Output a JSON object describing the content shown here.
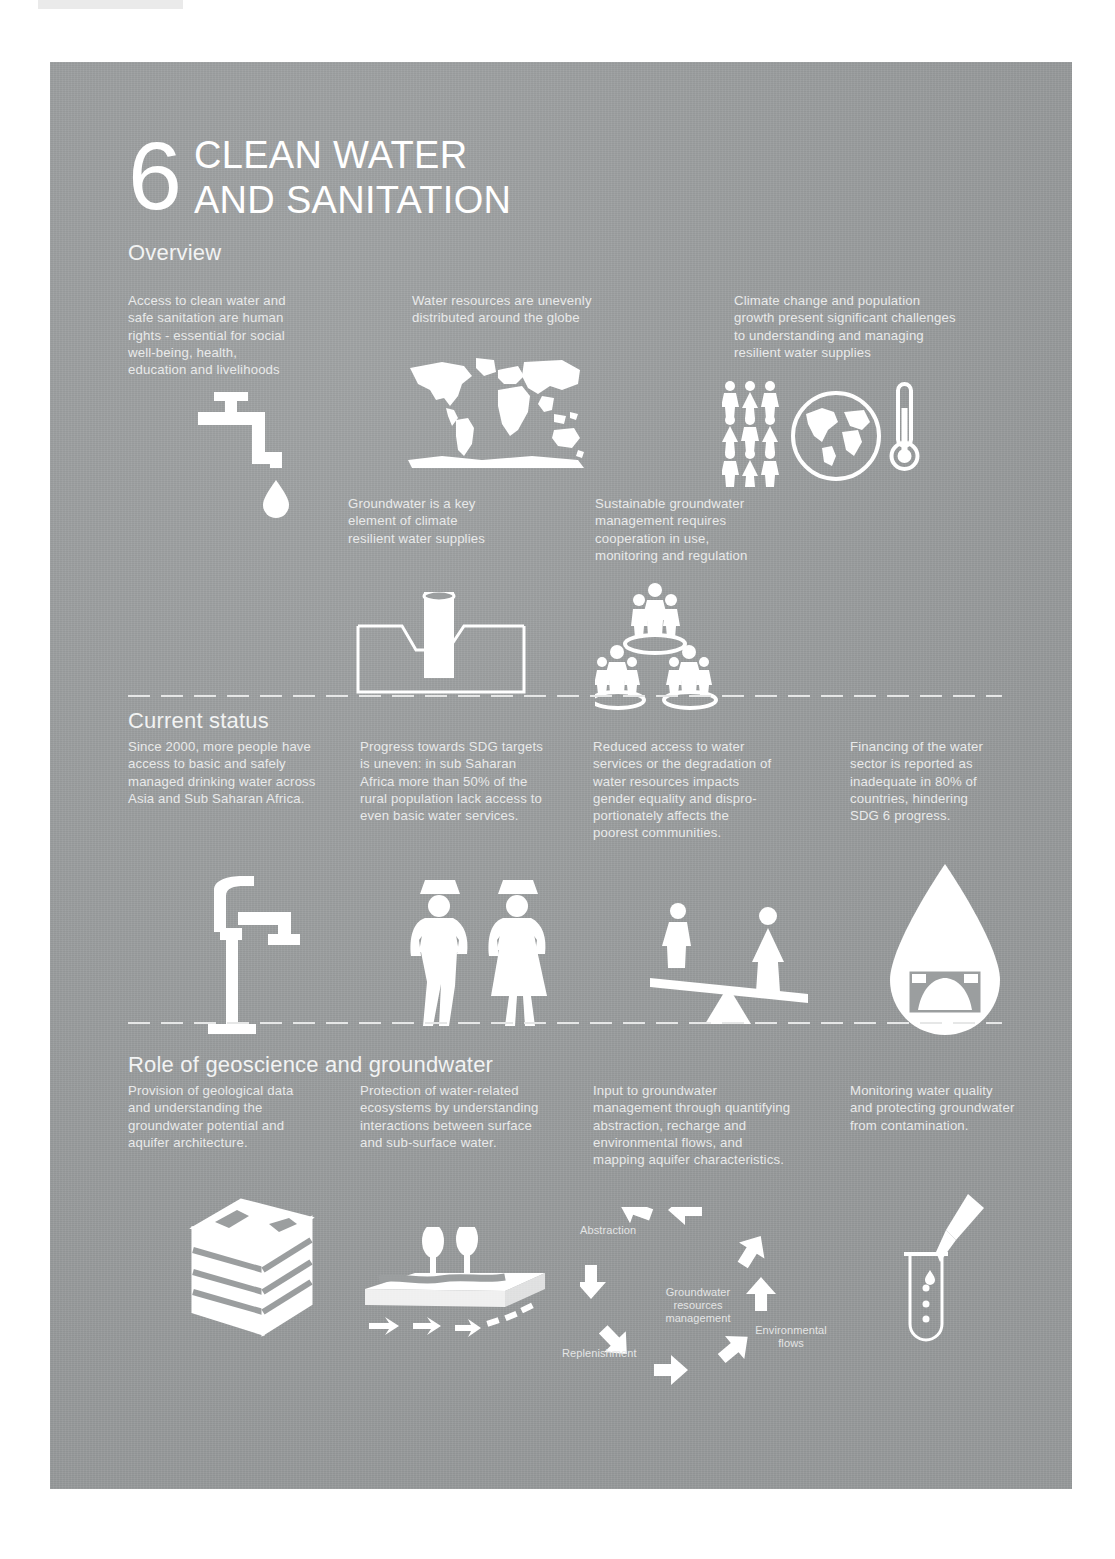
{
  "poster": {
    "goal_number": "6",
    "goal_title_line1": "CLEAN WATER",
    "goal_title_line2": "AND SANITATION",
    "accent_color": "#ffffff",
    "background_color": "#9b9e9f",
    "text_color": "#e9eaea"
  },
  "sections": {
    "overview": {
      "heading": "Overview",
      "blocks": [
        {
          "id": "ov-t1",
          "text": "Access to clean water and\nsafe sanitation are human\nrights - essential for social\nwell-being, health,\neducation and livelihoods",
          "icon": "water-tap-icon"
        },
        {
          "id": "ov-t2",
          "text": "Water resources are unevenly\ndistributed around the globe",
          "icon": "world-map-icon"
        },
        {
          "id": "ov-t3",
          "text": "Climate change and population\ngrowth present significant challenges\nto understanding and managing\nresilient water supplies",
          "icon": "climate-population-icon"
        },
        {
          "id": "ov-t4",
          "text": "Groundwater is a key\nelement of climate\nresilient water supplies",
          "icon": "borehole-icon"
        },
        {
          "id": "ov-t5",
          "text": "Sustainable groundwater\nmanagement requires\ncooperation in use,\nmonitoring and regulation",
          "icon": "cooperation-people-icon"
        }
      ]
    },
    "current_status": {
      "heading": "Current status",
      "blocks": [
        {
          "id": "cs-t1",
          "text": "Since 2000, more people have\naccess to basic and safely\nmanaged drinking water across\nAsia and Sub Saharan Africa.",
          "icon": "hand-pump-icon"
        },
        {
          "id": "cs-t2",
          "text": "Progress towards SDG targets\nis uneven: in sub Saharan\nAfrica more than 50% of the\nrural population lack access to\neven basic water services.",
          "icon": "water-carriers-icon"
        },
        {
          "id": "cs-t3",
          "text": "Reduced access to water\nservices or the degradation of\nwater resources impacts\ngender equality and dispro-\nportionately affects the\npoorest communities.",
          "icon": "gender-seesaw-icon"
        },
        {
          "id": "cs-t4",
          "text": "Financing of the water\nsector is reported as\ninadequate in 80% of\ncountries, hindering\nSDG 6 progress.",
          "icon": "water-droplet-banknote-icon"
        }
      ]
    },
    "role": {
      "heading": "Role of geoscience and groundwater",
      "blocks": [
        {
          "id": "rl-t1",
          "text": "Provision of geological data\nand understanding the\ngroundwater potential and\naquifer architecture.",
          "icon": "geological-block-icon"
        },
        {
          "id": "rl-t2",
          "text": "Protection of water-related\necosystems by understanding\ninteractions between surface\nand sub-surface water.",
          "icon": "ecosystem-cross-section-icon"
        },
        {
          "id": "rl-t3",
          "text": "Input to groundwater\nmanagement through quantifying\nabstraction, recharge and\nenvironmental flows, and\nmapping aquifer characteristics.",
          "icon": "management-cycle-icon"
        },
        {
          "id": "rl-t4",
          "text": "Monitoring water quality\nand protecting groundwater\nfrom contamination.",
          "icon": "test-tube-pipette-icon"
        }
      ]
    }
  },
  "cycle_diagram": {
    "center_label": "Groundwater\nresources\nmanagement",
    "abstraction_label": "Abstraction",
    "environmental_flows_label": "Environmental\nflows",
    "replenishment_label": "Replenishment"
  }
}
